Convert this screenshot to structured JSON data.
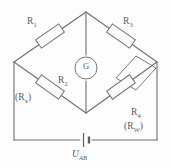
{
  "diagram": {
    "type": "wheatstone-bridge-circuit",
    "labels": {
      "r1": "R",
      "r1_sub": "1",
      "r3": "R",
      "r3_sub": "3",
      "r2": "R",
      "r2_sub": "2",
      "rx_open": "(R",
      "rx_sub": "x",
      "rx_close": ")",
      "r4": "R",
      "r4_sub": "4",
      "rw_open": "(R",
      "rw_sub": "W",
      "rw_close": ")",
      "galvanometer": "G",
      "source": "U",
      "source_sub": "AB"
    },
    "components": {
      "resistor_upper_left": "R1",
      "resistor_upper_right": "R3",
      "resistor_lower_left": "R2 (Rx)",
      "resistor_lower_right": "R4 (RW)",
      "meter": "galvanometer-G",
      "supply": "battery-cell",
      "shorting_link": "parallelogram-link-across-R4"
    },
    "colors": {
      "wire": "#6e6e6e",
      "text": "#5a5a5a",
      "background": "#fdfdfd"
    }
  }
}
